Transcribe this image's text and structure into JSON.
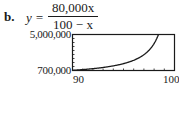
{
  "problem": {
    "label": "b.",
    "equation_lhs": "y =",
    "numerator": "80,000x",
    "denominator": "100 − x"
  },
  "chart_data": {
    "type": "line",
    "xlabel": "",
    "ylabel": "",
    "xlim": [
      90,
      100
    ],
    "ylim": [
      700000,
      5000000
    ],
    "x_tick_labels": [
      "90",
      "100"
    ],
    "y_tick_labels": [
      "700,000",
      "5,000,000"
    ],
    "grid": false,
    "legend": null,
    "series": [
      {
        "name": "y = 80000x/(100-x)",
        "x": [
          90,
          91,
          92,
          93,
          94,
          95,
          96,
          97,
          97.5,
          98,
          98.3
        ],
        "values": [
          720000,
          808889,
          920000,
          1062857,
          1253333,
          1520000,
          1920000,
          2586667,
          3120000,
          3920000,
          4625882
        ]
      }
    ]
  }
}
